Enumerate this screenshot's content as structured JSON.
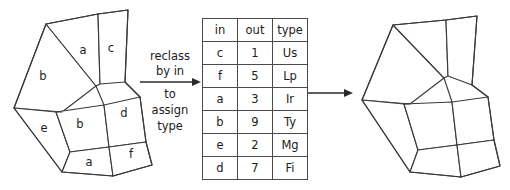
{
  "diagram": {
    "title": "reclass by in to assign type",
    "caption": {
      "lines": [
        "reclass",
        "by in",
        "to",
        "assign",
        "type"
      ],
      "line1": "reclass",
      "line2": "by in",
      "line3": "to",
      "line4": "assign",
      "line5": "type"
    },
    "colors": {
      "stroke": "#3a3a3a",
      "fill": "#ffffff",
      "text": "#1c1c1c",
      "arrow": "#2a2a2a",
      "table_border": "#4a4a4a"
    },
    "source_map": {
      "name": "input-polygon-map",
      "labels": [
        "b",
        "a",
        "c",
        "e",
        "b",
        "d",
        "a",
        "f"
      ],
      "label_b_upper": "b",
      "label_a_upper": "a",
      "label_c": "c",
      "label_e": "e",
      "label_b_lower": "b",
      "label_d": "d",
      "label_a_lower": "a",
      "label_f": "f"
    },
    "result_map": {
      "name": "output-polygon-map",
      "labels": []
    }
  },
  "table": {
    "name": "reclass-lookup-table",
    "headers": [
      "in",
      "out",
      "type"
    ],
    "header_in": "in",
    "header_out": "out",
    "header_type": "type",
    "rows": [
      {
        "in": "c",
        "out": "1",
        "type": "Us"
      },
      {
        "in": "f",
        "out": "5",
        "type": "Lp"
      },
      {
        "in": "a",
        "out": "3",
        "type": "Ir"
      },
      {
        "in": "b",
        "out": "9",
        "type": "Ty"
      },
      {
        "in": "e",
        "out": "2",
        "type": "Mg"
      },
      {
        "in": "d",
        "out": "7",
        "type": "Fi"
      }
    ]
  },
  "arrows": {
    "left_arrow_name": "reclass-arrow",
    "right_arrow_name": "apply-arrow"
  }
}
